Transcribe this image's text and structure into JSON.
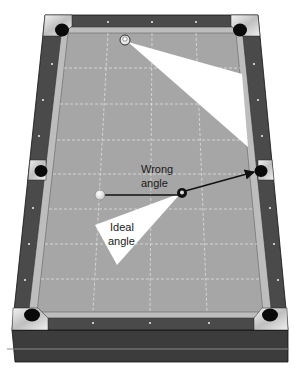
{
  "diagram": {
    "labels": {
      "wrong_angle_line1": "Wrong",
      "wrong_angle_line2": "angle",
      "ideal_angle_line1": "Ideal",
      "ideal_angle_line2": "angle"
    },
    "balls": [
      {
        "name": "object-ball-top",
        "description": "striped ball near head rail"
      },
      {
        "name": "cue-ball",
        "description": "white cue ball"
      },
      {
        "name": "nine-ball",
        "description": "black ball with number"
      }
    ],
    "pockets": [
      "top-left",
      "top-right",
      "side-left",
      "side-right",
      "bottom-left",
      "bottom-right"
    ],
    "colors": {
      "felt": "#a6a6a6",
      "cushion": "#bdbdbd",
      "rail_wood": "#4a4a4a",
      "rail_front": "#3c3c3c",
      "pocket": "#0a0a0a",
      "pocket_plate": "#dcdcdc",
      "grid_line": "#e6e6e6",
      "highlight_triangle": "#ffffff",
      "arrow": "#111111",
      "rule_line": "#888888"
    }
  }
}
